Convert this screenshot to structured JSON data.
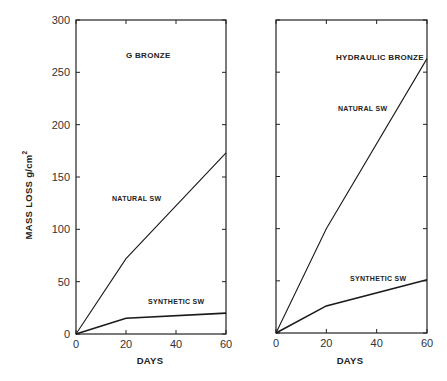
{
  "chart_data": [
    {
      "type": "line",
      "title": "G BRONZE",
      "xlabel": "DAYS",
      "ylabel": "MASS LOSS g/cm²",
      "x": [
        0,
        20,
        60
      ],
      "xlim": [
        0,
        60
      ],
      "ylim": [
        0,
        300
      ],
      "xticks": [
        "0",
        "20",
        "40",
        "60"
      ],
      "yticks": [
        "0",
        "50",
        "100",
        "150",
        "200",
        "250",
        "300"
      ],
      "grid": false,
      "series": [
        {
          "name": "NATURAL SW",
          "values": [
            0,
            72,
            173
          ]
        },
        {
          "name": "SYNTHETIC SW",
          "values": [
            0,
            15,
            20
          ]
        }
      ]
    },
    {
      "type": "line",
      "title": "HYDRAULIC BRONZE",
      "xlabel": "DAYS",
      "ylabel": "MASS LOSS g/cm²",
      "x": [
        0,
        20,
        60
      ],
      "xlim": [
        0,
        60
      ],
      "ylim": [
        0,
        300
      ],
      "xticks": [
        "0",
        "20",
        "40",
        "60"
      ],
      "yticks": [],
      "grid": false,
      "series": [
        {
          "name": "NATURAL SW",
          "values": [
            0,
            100,
            263
          ]
        },
        {
          "name": "SYNTHETIC SW",
          "values": [
            0,
            26,
            51
          ]
        }
      ]
    }
  ],
  "labels": {
    "ylabel": "MASS LOSS g/cm",
    "ylabel_sup": "2",
    "left_title": "G BRONZE",
    "right_title": "HYDRAULIC BRONZE",
    "left_natural": "NATURAL SW",
    "left_synthetic": "SYNTHETIC SW",
    "right_natural": "NATURAL SW",
    "right_synthetic": "SYNTHETIC SW",
    "xlabel_left": "DAYS",
    "xlabel_right": "DAYS",
    "yticks": [
      "0",
      "50",
      "100",
      "150",
      "200",
      "250",
      "300"
    ],
    "xticks": [
      "0",
      "20",
      "40",
      "60"
    ]
  }
}
